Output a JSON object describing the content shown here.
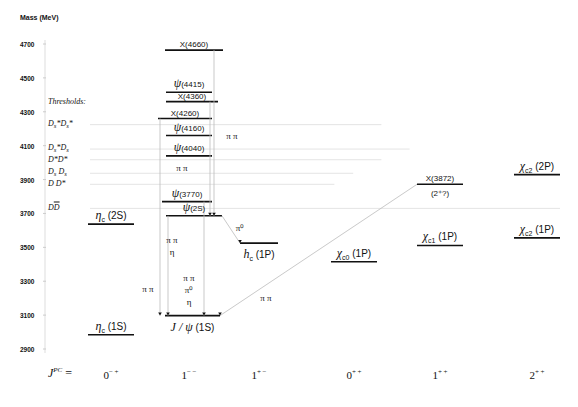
{
  "axis": {
    "title": "Mass (MeV)",
    "ticks": [
      "4700",
      "4500",
      "4300",
      "4100",
      "3900",
      "3700",
      "3500",
      "3300",
      "3100",
      "2900"
    ],
    "range": [
      2900,
      4700
    ]
  },
  "thresholds": {
    "title": "Thresholds:",
    "items": [
      {
        "label": "Ds*Ds*",
        "html": "D<sub>s</sub>*D<sub>s</sub>*",
        "mass": 4224,
        "extent": 0.62
      },
      {
        "label": "Ds*Ds",
        "html": "D<sub>s</sub>*D<sub>s</sub>",
        "mass": 4080,
        "extent": 0.68
      },
      {
        "label": "D*D*",
        "html": "D*D*",
        "mass": 4017,
        "extent": 0.62
      },
      {
        "label": "Ds Ds",
        "html": "D<sub>s</sub> D<sub>s</sub>",
        "mass": 3937,
        "extent": 0.56
      },
      {
        "label": "D D*",
        "html": "D D*",
        "mass": 3872,
        "extent": 0.52
      },
      {
        "label": "D Dbar",
        "html": "D<span style=\"text-decoration:overline\">D</span>",
        "mass": 3730,
        "extent": 1.0
      }
    ]
  },
  "levels": [
    {
      "id": "eta-c-1s",
      "label_greek": "η",
      "label_sub": "c",
      "label_rest": " (1S)",
      "mass": 2984,
      "column": "0-+"
    },
    {
      "id": "eta-c-2s",
      "label_greek": "η",
      "label_sub": "c",
      "label_rest": " (2S)",
      "mass": 3637,
      "column": "0-+"
    },
    {
      "id": "jpsi-1s",
      "label_greek": "J / ψ",
      "label_sub": "",
      "label_rest": " (1S)",
      "mass": 3097,
      "column": "1--",
      "label_below": true
    },
    {
      "id": "psi-2s",
      "label_greek": "ψ",
      "label_sub": "",
      "label_rest": "(2S)",
      "mass": 3686,
      "column": "1--"
    },
    {
      "id": "psi-3770",
      "label_greek": "ψ",
      "label_sub": "",
      "label_rest": "(3770)",
      "mass": 3770,
      "column": "1--"
    },
    {
      "id": "psi-4040",
      "label_greek": "ψ",
      "label_sub": "",
      "label_rest": "(4040)",
      "mass": 4040,
      "column": "1--"
    },
    {
      "id": "psi-4160",
      "label_greek": "ψ",
      "label_sub": "",
      "label_rest": "(4160)",
      "mass": 4160,
      "column": "1--"
    },
    {
      "id": "x-4260",
      "label_greek": "",
      "label_sub": "",
      "label_rest": "X(4260)",
      "mass": 4260,
      "column": "1--"
    },
    {
      "id": "x-4360",
      "label_greek": "",
      "label_sub": "",
      "label_rest": "X(4360)",
      "mass": 4360,
      "column": "1--"
    },
    {
      "id": "psi-4415",
      "label_greek": "ψ",
      "label_sub": "",
      "label_rest": "(4415)",
      "mass": 4415,
      "column": "1--"
    },
    {
      "id": "x-4660",
      "label_greek": "",
      "label_sub": "",
      "label_rest": "X(4660)",
      "mass": 4664,
      "column": "1--"
    },
    {
      "id": "hc-1p",
      "label_greek": "h",
      "label_sub": "c",
      "label_rest": " (1P)",
      "mass": 3525,
      "column": "1+-",
      "label_below": true
    },
    {
      "id": "chi-c0-1p",
      "label_greek": "χ",
      "label_sub": "c0",
      "label_rest": " (1P)",
      "mass": 3415,
      "column": "0++"
    },
    {
      "id": "chi-c1-1p",
      "label_greek": "χ",
      "label_sub": "c1",
      "label_rest": " (1P)",
      "mass": 3511,
      "column": "1++"
    },
    {
      "id": "x-3872",
      "label_greek": "",
      "label_sub": "",
      "label_rest": "X(3872)",
      "mass": 3872,
      "column": "1++",
      "note": "(2⁺?)"
    },
    {
      "id": "chi-c2-1p",
      "label_greek": "χ",
      "label_sub": "c2",
      "label_rest": " (1P)",
      "mass": 3556,
      "column": "2++"
    },
    {
      "id": "chi-c2-2p",
      "label_greek": "χ",
      "label_sub": "c2",
      "label_rest": " (2P)",
      "mass": 3929,
      "column": "2++"
    }
  ],
  "transitions": [
    {
      "from": "x-4660",
      "to": "psi-2s",
      "label": "π π"
    },
    {
      "from": "x-4260",
      "to": "jpsi-1s",
      "label": "π π"
    },
    {
      "from": "x-4360",
      "to": "psi-2s",
      "label": "π π"
    },
    {
      "from": "psi-2s",
      "to": "jpsi-1s",
      "label": "π π\nη"
    },
    {
      "from": "psi-3770",
      "to": "jpsi-1s",
      "label": "π π\nπ⁰\nη"
    },
    {
      "from": "psi-2s",
      "to": "hc-1p",
      "label": "π⁰"
    },
    {
      "from": "x-3872",
      "to": "jpsi-1s",
      "label": "π π"
    }
  ],
  "jpc": {
    "prefix": "J",
    "prefix_sup": "PC",
    "equals": " =",
    "columns": [
      {
        "j": "0",
        "pc": "− +"
      },
      {
        "j": "1",
        "pc": "− −"
      },
      {
        "j": "1",
        "pc": "+ −"
      },
      {
        "j": "0",
        "pc": "+ +"
      },
      {
        "j": "1",
        "pc": "+ +"
      },
      {
        "j": "2",
        "pc": "+ +"
      }
    ]
  }
}
